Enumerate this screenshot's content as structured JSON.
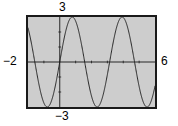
{
  "figure": {
    "name": "graphing-calculator-window",
    "background_color": "#ffffff",
    "plot_background_color": "#cdcdcd",
    "frame_color": "#1a1a1a",
    "curve_color": "#1a1a1a"
  },
  "labels": {
    "y_max": "3",
    "y_min": "−3",
    "x_min": "−2",
    "x_max": "6"
  },
  "chart_data": {
    "type": "line",
    "title": "",
    "xlabel": "",
    "ylabel": "",
    "xlim": [
      -2,
      6
    ],
    "ylim": [
      -3,
      3
    ],
    "grid": false,
    "legend": "none",
    "x_tick_labels": [
      "−2",
      "6"
    ],
    "y_tick_labels": [
      "3",
      "−3"
    ],
    "x_tick_interval": 1,
    "y_tick_interval": 1,
    "axes_shown": true,
    "equation": "y = 3 sin(2x)",
    "amplitude": 3,
    "period": 3.1416,
    "series": [
      {
        "name": "y = 3 sin(2x)",
        "x": [
          -2.0,
          -1.9,
          -1.8,
          -1.7,
          -1.6,
          -1.5,
          -1.4,
          -1.3,
          -1.2,
          -1.1,
          -1.0,
          -0.9,
          -0.8,
          -0.7,
          -0.6,
          -0.5,
          -0.4,
          -0.3,
          -0.2,
          -0.1,
          0.0,
          0.1,
          0.2,
          0.3,
          0.4,
          0.5,
          0.6,
          0.7,
          0.8,
          0.9,
          1.0,
          1.1,
          1.2,
          1.3,
          1.4,
          1.5,
          1.6,
          1.7,
          1.8,
          1.9,
          2.0,
          2.1,
          2.2,
          2.3,
          2.4,
          2.5,
          2.6,
          2.7,
          2.8,
          2.9,
          3.0,
          3.1,
          3.2,
          3.3,
          3.4,
          3.5,
          3.6,
          3.7,
          3.8,
          3.9,
          4.0,
          4.1,
          4.2,
          4.3,
          4.4,
          4.5,
          4.6,
          4.7,
          4.8,
          4.9,
          5.0,
          5.1,
          5.2,
          5.3,
          5.4,
          5.5,
          5.6,
          5.7,
          5.8,
          5.9,
          6.0
        ],
        "y": [
          2.27,
          2.72,
          2.96,
          2.99,
          2.79,
          2.38,
          1.81,
          1.12,
          0.38,
          -0.36,
          -1.06,
          -1.68,
          -2.19,
          -2.58,
          -2.82,
          -2.9,
          -2.81,
          -2.56,
          -2.15,
          -1.62,
          0.0,
          0.6,
          1.17,
          1.69,
          2.15,
          2.52,
          2.8,
          2.95,
          2.99,
          2.9,
          2.68,
          2.37,
          1.95,
          1.48,
          0.96,
          0.42,
          -0.17,
          -0.76,
          -1.32,
          -1.82,
          -2.27,
          -2.64,
          -2.88,
          -2.99,
          -2.97,
          -2.82,
          -2.55,
          -2.16,
          -1.68,
          -1.15,
          -0.59,
          -0.01,
          0.56,
          1.12,
          1.63,
          2.09,
          2.47,
          2.76,
          2.94,
          3.0,
          2.93,
          -2.75,
          2.46,
          2.07,
          1.6,
          1.08,
          0.53,
          -0.04,
          -0.61,
          -1.17,
          -1.68,
          -2.13,
          -2.5,
          -2.78,
          -2.95,
          -3.0,
          -2.92,
          -2.73,
          -2.43,
          -2.04,
          -1.57
        ]
      }
    ]
  }
}
